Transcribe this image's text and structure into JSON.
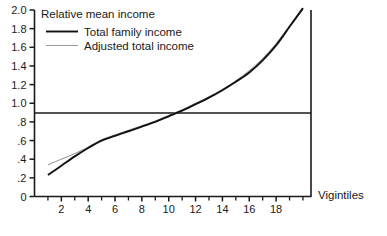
{
  "chart_data": {
    "type": "line",
    "title": "Relative mean income",
    "xlabel": "Vigintiles",
    "ylabel": "Relative mean income",
    "xlim": [
      0,
      20.6
    ],
    "ylim": [
      0,
      2.0
    ],
    "grid": false,
    "reference_line": {
      "axis": "y",
      "value": 1.0,
      "label": "1.0"
    },
    "legend_position": "top-left",
    "x": [
      1,
      2,
      3,
      4,
      5,
      6,
      7,
      8,
      9,
      10,
      11,
      12,
      13,
      14,
      15,
      16,
      17,
      18,
      19,
      20
    ],
    "series": [
      {
        "name": "Total family income",
        "style": "solid",
        "color": "#111111",
        "values": [
          0.23,
          0.33,
          0.43,
          0.52,
          0.6,
          0.65,
          0.7,
          0.75,
          0.8,
          0.86,
          0.92,
          0.99,
          1.06,
          1.14,
          1.23,
          1.33,
          1.46,
          1.62,
          1.82,
          2.02
        ]
      },
      {
        "name": "Adjusted total income",
        "style": "thin",
        "color": "#8a8a8a",
        "values": [
          0.34,
          0.4,
          0.46,
          0.53,
          0.61,
          0.66,
          0.71,
          0.76,
          0.81,
          0.87,
          0.93,
          1.0,
          1.07,
          1.15,
          1.24,
          1.35,
          1.48,
          1.64,
          1.83,
          2.0
        ]
      }
    ],
    "y_ticks": [
      {
        "value": 2.0,
        "label": "2.0"
      },
      {
        "value": 1.8,
        "label": "1.8"
      },
      {
        "value": 1.6,
        "label": "1.6"
      },
      {
        "value": 1.4,
        "label": "1.4"
      },
      {
        "value": 1.2,
        "label": "1.2"
      },
      {
        "value": 1.0,
        "label": "1.0"
      },
      {
        "value": 0.8,
        "label": ".8"
      },
      {
        "value": 0.6,
        "label": ".6"
      },
      {
        "value": 0.4,
        "label": ".4"
      },
      {
        "value": 0.2,
        "label": ".2"
      },
      {
        "value": 0.0,
        "label": "0"
      }
    ],
    "x_ticks": [
      {
        "value": 2,
        "label": "2"
      },
      {
        "value": 4,
        "label": "4"
      },
      {
        "value": 6,
        "label": "6"
      },
      {
        "value": 8,
        "label": "8"
      },
      {
        "value": 10,
        "label": "10"
      },
      {
        "value": 12,
        "label": "12"
      },
      {
        "value": 14,
        "label": "14"
      },
      {
        "value": 16,
        "label": "16"
      },
      {
        "value": 18,
        "label": "18"
      }
    ],
    "x_minor_ticks": [
      1,
      3,
      5,
      7,
      9,
      11,
      13,
      15,
      17,
      19,
      20
    ]
  },
  "legend": {
    "entries": [
      {
        "label": "Total family income"
      },
      {
        "label": "Adjusted total income"
      }
    ]
  }
}
